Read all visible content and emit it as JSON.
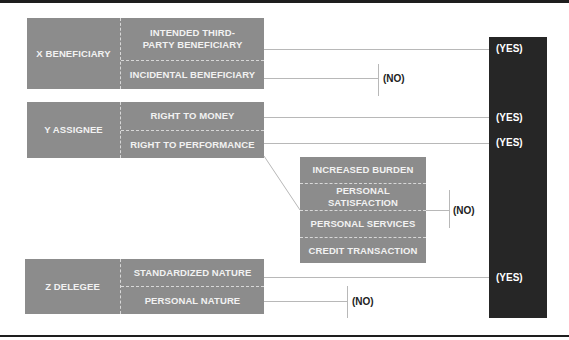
{
  "groups": [
    {
      "title": "X BENEFICIARY",
      "items": [
        "INTENDED THIRD-PARTY BENEFICIARY",
        "INCIDENTAL BENEFICIARY"
      ]
    },
    {
      "title": "Y ASSIGNEE",
      "items": [
        "RIGHT TO MONEY",
        "RIGHT TO PERFORMANCE"
      ]
    },
    {
      "title": "Z DELEGEE",
      "items": [
        "STANDARDIZED NATURE",
        "PERSONAL NATURE"
      ]
    }
  ],
  "exceptions": [
    "INCREASED BURDEN",
    "PERSONAL SATISFACTION",
    "PERSONAL SERVICES",
    "CREDIT TRANSACTION"
  ],
  "outcomes": {
    "yes": "(YES)",
    "no": "(NO)"
  },
  "colors": {
    "box": "#8c8c8c",
    "dark": "#262626",
    "text": "#f2f2f2"
  }
}
